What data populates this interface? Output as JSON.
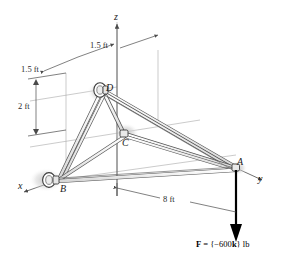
{
  "figure": {
    "nodes": [
      {
        "id": "A",
        "label": "A",
        "x": 236,
        "y": 168
      },
      {
        "id": "B",
        "label": "B",
        "x": 58,
        "y": 180
      },
      {
        "id": "C",
        "label": "C",
        "x": 123,
        "y": 135
      },
      {
        "id": "D",
        "label": "D",
        "x": 103,
        "y": 90
      }
    ],
    "node_labels": {
      "a": "A",
      "b": "B",
      "c": "C",
      "d": "D"
    },
    "axes": {
      "x_label": "x",
      "y_label": "y",
      "z_label": "z"
    },
    "dimensions": {
      "top_left": "1.5 ft",
      "top_right": "1.5 ft",
      "vertical": "2 ft",
      "horizontal": "8 ft"
    },
    "force": {
      "prefix": "F",
      "equals": " = {",
      "magnitude": "−600",
      "unit_vector": "k",
      "close": "} lb",
      "full_text": "F = {−600k} lb",
      "direction": "downward"
    },
    "colors": {
      "line": "#3a3a3a",
      "member_fill": "#f2f2f2",
      "shadow": "#d8d8d8",
      "force_arrow": "#000000",
      "thin_line": "#9a9a9a"
    }
  }
}
